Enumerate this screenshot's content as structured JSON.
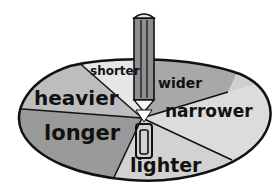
{
  "illustration": {
    "description": "Spinner with a pencil at the center pointing to comparison words",
    "segments": [
      {
        "label": "shorter",
        "shade": "#e6e6e6"
      },
      {
        "label": "wider",
        "shade": "#a8a8a8"
      },
      {
        "label": "heavier",
        "shade": "#bdbdbd"
      },
      {
        "label": "narrower",
        "shade": "#dcdcdc"
      },
      {
        "label": "longer",
        "shade": "#9a9a9a"
      },
      {
        "label": "lighter",
        "shade": "#d2d2d2"
      }
    ],
    "pointer": "pencil-spinner-icon",
    "outline_color": "#111111"
  }
}
